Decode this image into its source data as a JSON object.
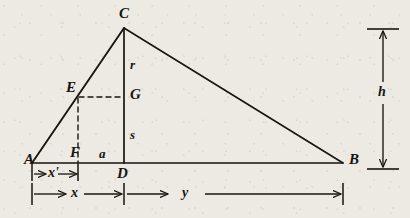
{
  "figure": {
    "kind": "geometry-diagram",
    "background_color": "#eceae3",
    "ink_color": "#17150f",
    "points": {
      "A": {
        "label": "A",
        "x": 32,
        "y": 163,
        "label_x": 24,
        "label_y": 156
      },
      "B": {
        "label": "B",
        "x": 343,
        "y": 163,
        "label_x": 349,
        "label_y": 156
      },
      "C": {
        "label": "C",
        "x": 124,
        "y": 28,
        "label_x": 119,
        "label_y": 10
      },
      "D": {
        "label": "D",
        "x": 124,
        "y": 163,
        "label_x": 118,
        "label_y": 167
      },
      "E": {
        "label": "E",
        "x": 78,
        "y": 97,
        "label_x": 67,
        "label_y": 84
      },
      "F": {
        "label": "F",
        "x": 78,
        "y": 163,
        "label_x": 71,
        "label_y": 149
      },
      "G": {
        "label": "G",
        "x": 124,
        "y": 97,
        "label_x": 130,
        "label_y": 90
      }
    },
    "segment_labels": {
      "r": {
        "label": "r",
        "x": 131,
        "y": 62,
        "meaning": "C-to-G portion of altitude"
      },
      "s": {
        "label": "s",
        "x": 131,
        "y": 131,
        "meaning": "G-to-D portion of altitude"
      },
      "a": {
        "label": "a",
        "x": 100,
        "y": 150,
        "meaning": "F-to-D portion of base"
      }
    },
    "dimensions": [
      {
        "name": "x-prime",
        "label": "x'",
        "x1": 32,
        "x2": 78,
        "y": 174,
        "label_x": 48,
        "label_y": 165,
        "orientation": "horizontal",
        "arrows": "both"
      },
      {
        "name": "x",
        "label": "x",
        "x1": 32,
        "x2": 124,
        "y": 194,
        "label_x": 73,
        "label_y": 184,
        "orientation": "horizontal",
        "arrows": "both"
      },
      {
        "name": "y",
        "label": "y",
        "x1": 124,
        "x2": 343,
        "y": 194,
        "label_x": 192,
        "label_y": 184,
        "orientation": "horizontal",
        "arrows": "both"
      },
      {
        "name": "h",
        "label": "h",
        "y1": 30,
        "y2": 168,
        "x": 383,
        "label_x": 388,
        "label_y": 92,
        "orientation": "vertical",
        "arrows": "both"
      }
    ],
    "solid_lines": [
      {
        "name": "side-AC",
        "from": "A",
        "to": "C"
      },
      {
        "name": "side-CB",
        "from": "C",
        "to": "B"
      },
      {
        "name": "base-AB",
        "from": "A",
        "to": "B"
      },
      {
        "name": "altitude-CD",
        "from": "C",
        "to": "D"
      }
    ],
    "dashed_lines": [
      {
        "name": "segment-EG",
        "from": "E",
        "to": "G"
      },
      {
        "name": "segment-EF",
        "from": "E",
        "to": "F"
      }
    ]
  }
}
